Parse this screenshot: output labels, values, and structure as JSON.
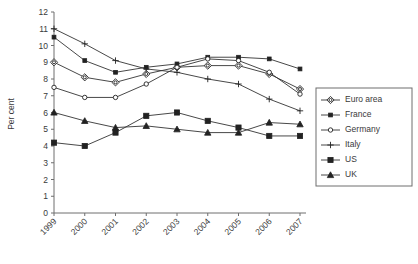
{
  "chart_data": {
    "type": "line",
    "title": "",
    "xlabel": "",
    "ylabel": "Per cent",
    "categories": [
      "1999",
      "2000",
      "2001",
      "2002",
      "2003",
      "2004",
      "2005",
      "2006",
      "2007"
    ],
    "ylim": [
      0,
      12
    ],
    "ytick_step": 1,
    "yticks": [
      "0",
      "1",
      "2",
      "3",
      "4",
      "5",
      "6",
      "7",
      "8",
      "9",
      "10",
      "11",
      "12"
    ],
    "grid": false,
    "legend_position": "right",
    "series": [
      {
        "name": "Euro area",
        "marker": "open-diamond",
        "values": [
          9.0,
          8.1,
          7.8,
          8.3,
          8.7,
          8.8,
          8.8,
          8.3,
          7.4
        ]
      },
      {
        "name": "France",
        "marker": "small-filled-square",
        "values": [
          10.5,
          9.1,
          8.4,
          8.7,
          8.9,
          9.3,
          9.3,
          9.2,
          8.6
        ]
      },
      {
        "name": "Germany",
        "marker": "open-circle",
        "values": [
          7.5,
          6.9,
          6.9,
          7.7,
          8.7,
          9.2,
          9.1,
          8.4,
          7.1
        ]
      },
      {
        "name": "Italy",
        "marker": "plus",
        "values": [
          11.0,
          10.1,
          9.1,
          8.6,
          8.4,
          8.0,
          7.7,
          6.8,
          6.1
        ]
      },
      {
        "name": "US",
        "marker": "filled-square",
        "values": [
          4.2,
          4.0,
          4.8,
          5.8,
          6.0,
          5.5,
          5.1,
          4.6,
          4.6
        ]
      },
      {
        "name": "UK",
        "marker": "filled-triangle",
        "values": [
          6.0,
          5.5,
          5.1,
          5.2,
          5.0,
          4.8,
          4.8,
          5.4,
          5.3
        ]
      }
    ]
  },
  "colors": {
    "line": "#333333",
    "axis": "#6e6e6e",
    "text": "#3a3a3a",
    "background": "#ffffff"
  }
}
